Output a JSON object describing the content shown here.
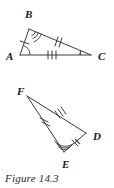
{
  "figure": {
    "caption": "Figure 14.3",
    "ink_color": "#3a3a3a",
    "background_color": "#ffffff",
    "triangles": [
      {
        "name": "triangle-abc",
        "vertices": [
          {
            "label": "A",
            "label_x": 6,
            "label_y": 60,
            "x": 20,
            "y": 55,
            "angle_arcs": 1
          },
          {
            "label": "B",
            "label_x": 25,
            "label_y": 18,
            "x": 29,
            "y": 29,
            "angle_arcs": 3
          },
          {
            "label": "C",
            "label_x": 98,
            "label_y": 60,
            "x": 91,
            "y": 55,
            "angle_arcs": 1
          }
        ],
        "sides": [
          {
            "name": "side-ab",
            "from": "A",
            "to": "B",
            "ticks": 1
          },
          {
            "name": "side-bc",
            "from": "B",
            "to": "C",
            "ticks": 2
          },
          {
            "name": "side-ac",
            "from": "A",
            "to": "C",
            "ticks": 3
          }
        ]
      },
      {
        "name": "triangle-fed",
        "vertices": [
          {
            "label": "F",
            "label_x": 17,
            "label_y": 95,
            "x": 27,
            "y": 96,
            "angle_arcs": 0
          },
          {
            "label": "E",
            "label_x": 62,
            "label_y": 168,
            "x": 64,
            "y": 152,
            "angle_arcs": 3
          },
          {
            "label": "D",
            "label_x": 93,
            "label_y": 140,
            "x": 86,
            "y": 133,
            "angle_arcs": 1
          }
        ],
        "sides": [
          {
            "name": "side-fd",
            "from": "F",
            "to": "D",
            "ticks": 3
          },
          {
            "name": "side-fe",
            "from": "F",
            "to": "E",
            "ticks": 2
          },
          {
            "name": "side-ed",
            "from": "E",
            "to": "D",
            "ticks": 1
          }
        ]
      }
    ]
  }
}
